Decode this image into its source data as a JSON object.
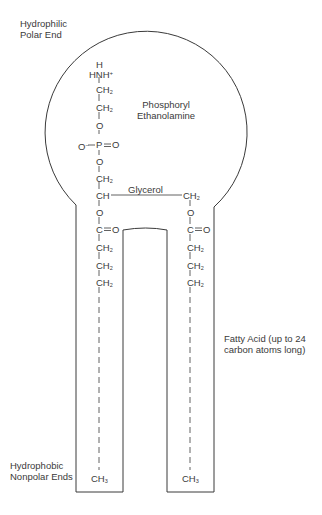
{
  "labels": {
    "hydrophilic_line1": "Hydrophilic",
    "hydrophilic_line2": "Polar End",
    "phosphoryl_line1": "Phosphoryl",
    "phosphoryl_line2": "Ethanolamine",
    "glycerol": "Glycerol",
    "fatty_acid_line1": "Fatty Acid (up to 24",
    "fatty_acid_line2": "carbon atoms long)",
    "hydrophobic_line1": "Hydrophobic",
    "hydrophobic_line2": "Nonpolar Ends"
  },
  "left_chain": {
    "h": "H",
    "hnh": "HNH",
    "plus": "+",
    "ch2_a": "CH",
    "ch2_b": "CH",
    "o1": "O",
    "o_minus": "O",
    "minus": "−",
    "p": "P",
    "o_double": "O",
    "o2": "O",
    "ch2_c": "CH",
    "ch": "CH",
    "o3": "O",
    "c": "C",
    "c_o": "O",
    "ch2_d": "CH",
    "ch2_e": "CH",
    "ch2_f": "CH",
    "ch3": "CH",
    "sub2": "2",
    "sub3": "3"
  },
  "right_chain": {
    "ch2_a": "CH",
    "o1": "O",
    "c": "C",
    "c_o": "O",
    "ch2_b": "CH",
    "ch2_c": "CH",
    "ch2_d": "CH",
    "ch3": "CH",
    "sub2": "2",
    "sub3": "3"
  }
}
